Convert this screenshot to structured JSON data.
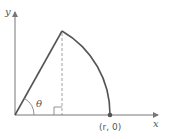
{
  "diagram": {
    "axis_x_label": "x",
    "axis_y_label": "y",
    "angle_label": "θ",
    "point_label": "(r, 0)",
    "colors": {
      "axis": "#777777",
      "curve": "#555555",
      "point": "#555555"
    }
  }
}
